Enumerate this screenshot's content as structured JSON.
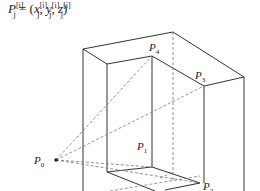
{
  "formula": {
    "lhs": "P",
    "lhs_sup": "[i]",
    "lhs_sub": "j",
    "equals": " = (",
    "x": "x",
    "y": "y",
    "z": "z",
    "sup": "[i]",
    "sub": "j",
    "sep": ", ",
    "close": ")"
  },
  "points": [
    {
      "name": "P",
      "index": "0"
    },
    {
      "name": "P",
      "index": "1"
    },
    {
      "name": "P",
      "index": "2"
    },
    {
      "name": "P",
      "index": "3"
    },
    {
      "name": "P",
      "index": "4"
    }
  ],
  "colors": {
    "line": "#333333",
    "dashed": "#777777"
  }
}
